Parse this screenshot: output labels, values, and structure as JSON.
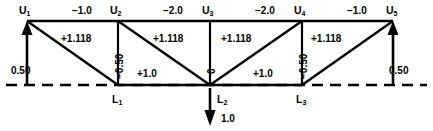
{
  "diagram": {
    "type": "truss-force-diagram",
    "title": "",
    "geometry": {
      "top_chord_y": 21,
      "bottom_chord_y": 85,
      "top_nodes_x": [
        27,
        118,
        210,
        302,
        393
      ],
      "bottom_nodes_x": [
        118,
        210,
        302
      ],
      "baseline_y": 85
    },
    "nodes": {
      "top": [
        {
          "id": "U1",
          "letter": "U",
          "sub": "1",
          "x": 27,
          "y": 21
        },
        {
          "id": "U2",
          "letter": "U",
          "sub": "2",
          "x": 118,
          "y": 21
        },
        {
          "id": "U3",
          "letter": "U",
          "sub": "3",
          "x": 210,
          "y": 21
        },
        {
          "id": "U4",
          "letter": "U",
          "sub": "4",
          "x": 302,
          "y": 21
        },
        {
          "id": "U5",
          "letter": "U",
          "sub": "5",
          "x": 393,
          "y": 21
        }
      ],
      "bottom": [
        {
          "id": "L1",
          "letter": "L",
          "sub": "1",
          "x": 118,
          "y": 85
        },
        {
          "id": "L2",
          "letter": "L",
          "sub": "2",
          "x": 210,
          "y": 85
        },
        {
          "id": "L3",
          "letter": "L",
          "sub": "3",
          "x": 302,
          "y": 85
        }
      ]
    },
    "top_chord_forces": [
      {
        "label": "−1.0",
        "between": "U1-U2",
        "x": 72,
        "y": 8
      },
      {
        "label": "−2.0",
        "between": "U2-U3",
        "x": 163,
        "y": 8
      },
      {
        "label": "−2.0",
        "between": "U3-U4",
        "x": 255,
        "y": 8
      },
      {
        "label": "−1.0",
        "between": "U4-U5",
        "x": 347,
        "y": 8
      }
    ],
    "bottom_chord_forces": [
      {
        "label": "+1.0",
        "between": "L1-L2",
        "x": 140,
        "y": 68
      },
      {
        "label": "+1.0",
        "between": "L2-L3",
        "x": 256,
        "y": 68
      }
    ],
    "diagonal_forces": [
      {
        "label": "+1.118",
        "between": "U1-L1",
        "x": 62,
        "y": 35
      },
      {
        "label": "+1.118",
        "between": "U2-L2",
        "x": 155,
        "y": 35
      },
      {
        "label": "+1.118",
        "between": "L2-U3",
        "x": 222,
        "y": 35
      },
      {
        "label": "+1.118",
        "between": "L3-U4",
        "x": 312,
        "y": 35
      }
    ],
    "vertical_forces": [
      {
        "label": "−0.50",
        "between": "U2-L1",
        "x": 115,
        "y": 78
      },
      {
        "label": "0",
        "between": "U3-L2",
        "x": 207,
        "y": 78
      },
      {
        "label": "−0.50",
        "between": "U4-L3",
        "x": 299,
        "y": 78
      }
    ],
    "reactions": [
      {
        "label": "0.50",
        "at": "U1",
        "direction": "up",
        "x": 14,
        "y": 66
      },
      {
        "label": "0.50",
        "at": "U5",
        "direction": "up",
        "x": 392,
        "y": 66
      }
    ],
    "loads": [
      {
        "label": "1.0",
        "at": "L2",
        "direction": "down",
        "x": 222,
        "y": 114
      }
    ],
    "colors": {
      "line": "#000000",
      "text": "#000000",
      "background": "#ffffff"
    }
  }
}
